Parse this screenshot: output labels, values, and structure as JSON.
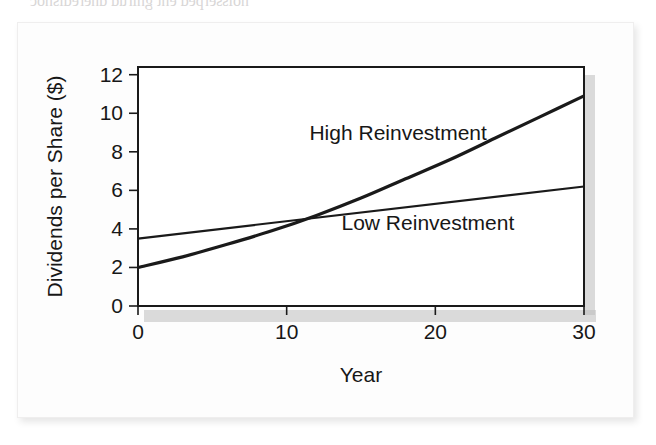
{
  "figure": {
    "caption_bleed_top": "noisserped eht gnirud dneredisnoc",
    "bleed_lines": [
      "dividend, that would be a",
      "in stock prices. What if they",
      "the reduced amount they",
      "the reinvestment rate, we",
      "the firm?",
      "and based on the value of",
      "reinvestment in the",
      "effect of reinvestment on",
      "the policy investors",
      "the value that investors",
      "Therefore, the share price only",
      "that the share price only"
    ]
  },
  "chart_data": {
    "type": "line",
    "title": "",
    "xlabel": "Year",
    "ylabel": "Dividends per Share ($)",
    "xlim": [
      0,
      30
    ],
    "ylim": [
      0,
      12.4
    ],
    "xticks": [
      0,
      10,
      20,
      30
    ],
    "yticks": [
      0,
      2,
      4,
      6,
      8,
      10,
      12
    ],
    "xticklabels": [
      "0",
      "10",
      "20",
      "30"
    ],
    "yticklabels": [
      "0",
      "2",
      "4",
      "6",
      "8",
      "10",
      "12"
    ],
    "grid": false,
    "legend_position": "inline-annotation",
    "crossover": {
      "x": 13.5,
      "y": 4.5
    },
    "series": [
      {
        "name": "High Reinvestment",
        "color": "#101010",
        "linewidth": 3.2,
        "style": "exponential-growth",
        "label_x": 17.5,
        "label_y": 8.6,
        "x": [
          0,
          3,
          6,
          9,
          12,
          15,
          18,
          21,
          24,
          27,
          30
        ],
        "values": [
          2.0,
          2.55,
          3.2,
          3.9,
          4.7,
          5.6,
          6.6,
          7.6,
          8.7,
          9.8,
          10.9
        ]
      },
      {
        "name": "Low Reinvestment",
        "color": "#6a6a6a",
        "linewidth": 2.2,
        "style": "linear",
        "label_x": 19.5,
        "label_y": 3.95,
        "x": [
          0,
          30
        ],
        "values": [
          3.5,
          6.2
        ]
      }
    ]
  }
}
